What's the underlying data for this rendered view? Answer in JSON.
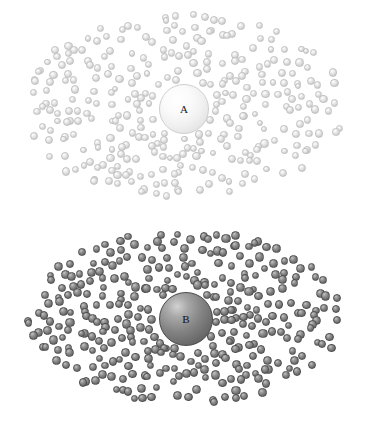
{
  "figure": {
    "type": "scientific-illustration",
    "background_color": "#ffffff",
    "width": 369,
    "height": 425
  },
  "panels": [
    {
      "id": "a",
      "label": "A",
      "label_color": "#1a1a1a",
      "core": {
        "cx": 183,
        "cy": 108,
        "r": 24,
        "fill_light": "#ffffff",
        "fill_dark": "#d6d6d6"
      },
      "particles": {
        "count": 310,
        "radius_px": 3.7,
        "color_light": "#ffffff",
        "color_mid": "#dcdcdc",
        "color_dark": "#bdbdbd",
        "field": {
          "cx": 183,
          "cy": 107,
          "x_min": 28,
          "x_max": 346,
          "y_min": 14,
          "y_max": 198
        }
      }
    },
    {
      "id": "b",
      "label": "B",
      "label_color": "#111111",
      "core": {
        "cx": 185,
        "cy": 318,
        "r": 26,
        "fill_light": "#d2d2d2",
        "fill_dark": "#535353"
      },
      "particles": {
        "count": 330,
        "radius_px": 4.1,
        "color_light": "#c8c8c8",
        "color_mid": "#7b7b7b",
        "color_dark": "#575757",
        "field": {
          "cx": 185,
          "cy": 317,
          "x_min": 28,
          "x_max": 340,
          "y_min": 233,
          "y_max": 404
        }
      }
    }
  ]
}
